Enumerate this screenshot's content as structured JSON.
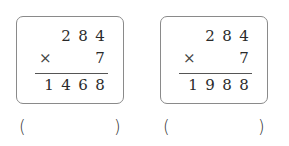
{
  "problems": [
    {
      "multiplicand": [
        "2",
        "8",
        "4"
      ],
      "operator": "×",
      "multiplier": "7",
      "product": [
        "1",
        "4",
        "6",
        "8"
      ],
      "answer_open": "(",
      "answer_close": ")"
    },
    {
      "multiplicand": [
        "2",
        "8",
        "4"
      ],
      "operator": "×",
      "multiplier": "7",
      "product": [
        "1",
        "9",
        "8",
        "8"
      ],
      "answer_open": "(",
      "answer_close": ")"
    }
  ]
}
